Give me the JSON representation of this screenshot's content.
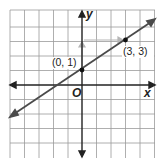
{
  "graph": {
    "x_axis_label": "x",
    "y_axis_label": "y",
    "origin_label": "O",
    "points": [
      {
        "label": "(0, 1)",
        "x": 0,
        "y": 1
      },
      {
        "label": "(3, 3)",
        "x": 3,
        "y": 3
      }
    ],
    "line": {
      "slope": "2/3",
      "y_intercept": 1
    },
    "grid": {
      "x_range": [
        -5,
        5
      ],
      "y_range": [
        -5,
        5
      ]
    },
    "colors": {
      "grid": "#9a9a9a",
      "axes": "#222222",
      "line": "#4a4a4a",
      "rise_run_arrows": "#b5b5b5"
    }
  }
}
